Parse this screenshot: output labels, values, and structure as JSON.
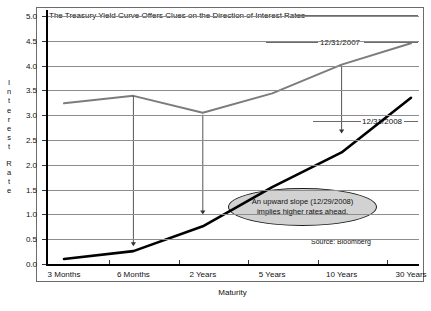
{
  "chart_data": {
    "type": "line",
    "title": "The Treasury Yield Curve Offers Clues on the Direction of Interest Rates",
    "xlabel": "Maturity",
    "ylabel": "Interest Rate",
    "ylim": [
      0.0,
      5.0
    ],
    "ytick_labels": [
      "0.0",
      "0.5",
      "1.0",
      "1.5",
      "2.0",
      "2.5",
      "3.0",
      "3.5",
      "4.0",
      "4.5",
      "5.0"
    ],
    "ytick_values": [
      0.0,
      0.5,
      1.0,
      1.5,
      2.0,
      2.5,
      3.0,
      3.5,
      4.0,
      4.5,
      5.0
    ],
    "grid": true,
    "legend_position": "inline-annotation",
    "categories": [
      "3 Months",
      "6 Months",
      "2 Years",
      "5 Years",
      "10 Years",
      "30 Years"
    ],
    "series": [
      {
        "name": "12/31/2007",
        "color": "#7c7c7c",
        "values": [
          3.24,
          3.39,
          3.05,
          3.44,
          4.02,
          4.45
        ]
      },
      {
        "name": "12/31/2008",
        "color": "#000000",
        "values": [
          0.1,
          0.26,
          0.76,
          1.55,
          2.25,
          3.35
        ]
      }
    ],
    "annotations": [
      {
        "name": "callout-bubble",
        "text_line1": "An upward slope (12/29/2008)",
        "text_line2": "implies higher rates ahead."
      },
      {
        "name": "source-note",
        "text": "Source: Bloomberg"
      }
    ],
    "arrows": [
      {
        "name": "arrow-6-months",
        "category": "6 Months",
        "from": 3.39,
        "to": 0.36
      },
      {
        "name": "arrow-2-years",
        "category": "2 Years",
        "from": 3.01,
        "to": 1.0
      },
      {
        "name": "arrow-10-years",
        "category": "10 Years",
        "from": 4.0,
        "to": 2.63
      }
    ]
  },
  "y_axis_letters": [
    "I",
    "n",
    "t",
    "e",
    "r",
    "e",
    "s",
    "t",
    "R",
    "a",
    "t",
    "e"
  ]
}
